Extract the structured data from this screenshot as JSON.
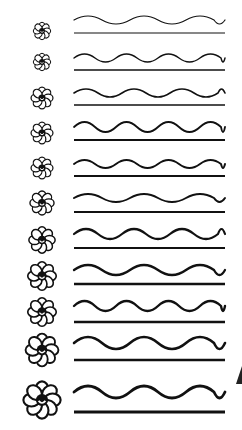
{
  "worksheet": {
    "title": "",
    "ink_color": "#111111",
    "background": "#ffffff",
    "rows": [
      {
        "flower_y": 31,
        "flower_r": 8,
        "wave_y": 20,
        "line_y": 33,
        "amp": 4,
        "stroke": 1.2,
        "wave": "long"
      },
      {
        "flower_y": 62,
        "flower_r": 8,
        "wave_y": 58,
        "line_y": 70,
        "amp": 4,
        "stroke": 1.4,
        "wave": "short"
      },
      {
        "flower_y": 98,
        "flower_r": 10,
        "wave_y": 93,
        "line_y": 105,
        "amp": 4,
        "stroke": 1.6,
        "wave": "mixed"
      },
      {
        "flower_y": 133,
        "flower_r": 10,
        "wave_y": 127,
        "line_y": 140,
        "amp": 5,
        "stroke": 1.8,
        "wave": "short"
      },
      {
        "flower_y": 168,
        "flower_r": 10,
        "wave_y": 164,
        "line_y": 176,
        "amp": 4,
        "stroke": 2.0,
        "wave": "short"
      },
      {
        "flower_y": 203,
        "flower_r": 11,
        "wave_y": 198,
        "line_y": 212,
        "amp": 4,
        "stroke": 2.0,
        "wave": "long"
      },
      {
        "flower_y": 240,
        "flower_r": 12,
        "wave_y": 234,
        "line_y": 248,
        "amp": 5,
        "stroke": 2.2,
        "wave": "mixed"
      },
      {
        "flower_y": 276,
        "flower_r": 13,
        "wave_y": 270,
        "line_y": 284,
        "amp": 5,
        "stroke": 2.3,
        "wave": "long"
      },
      {
        "flower_y": 312,
        "flower_r": 13,
        "wave_y": 306,
        "line_y": 322,
        "amp": 5,
        "stroke": 2.4,
        "wave": "short"
      },
      {
        "flower_y": 350,
        "flower_r": 15,
        "wave_y": 343,
        "line_y": 360,
        "amp": 6,
        "stroke": 2.6,
        "wave": "long"
      },
      {
        "flower_y": 400,
        "flower_r": 17,
        "wave_y": 392,
        "line_y": 412,
        "amp": 6,
        "stroke": 2.8,
        "wave": "long"
      }
    ]
  }
}
